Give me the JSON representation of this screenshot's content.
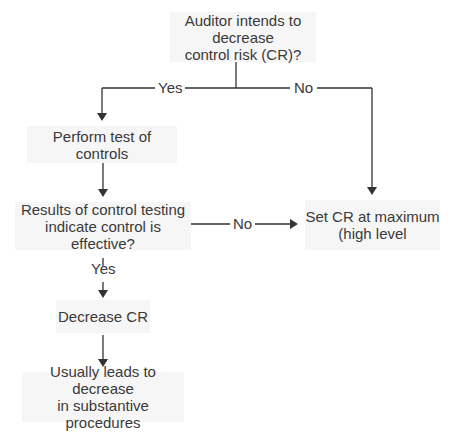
{
  "nodes": {
    "start": {
      "line1": "Auditor intends to decrease",
      "line2": "control risk (CR)?"
    },
    "perform": {
      "line1": "Perform test of controls"
    },
    "results": {
      "line1": "Results of control testing",
      "line2": "indicate control is effective?"
    },
    "max": {
      "line1": "Set CR at maximum",
      "line2": "(high level"
    },
    "decrease": {
      "line1": "Decrease CR"
    },
    "leads": {
      "line1": "Usually leads to decrease",
      "line2": "in substantive procedures"
    }
  },
  "edges": {
    "start_yes": "Yes",
    "start_no": "No",
    "results_no": "No",
    "results_yes": "Yes"
  },
  "colors": {
    "line": "#333333",
    "box": "#f6f6f6"
  }
}
